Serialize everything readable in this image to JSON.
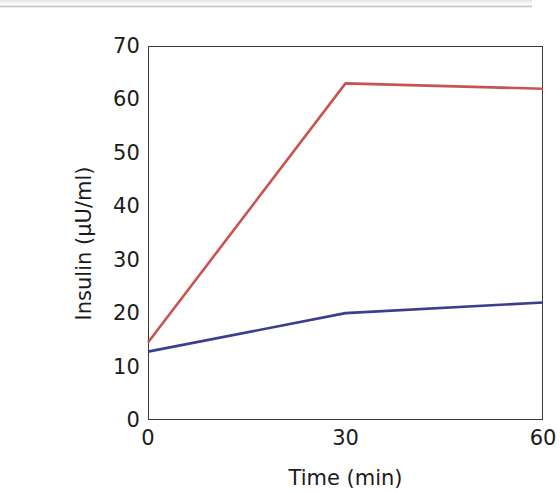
{
  "chart_data": {
    "type": "line",
    "title": "",
    "subtitle": "",
    "xlabel": "Time (min)",
    "ylabel": "Insulin  (μU/ml)",
    "xlim": [
      0,
      60
    ],
    "ylim": [
      0,
      70
    ],
    "xticks": [
      0,
      30,
      60
    ],
    "xticklabels": [
      "0",
      "30",
      "60"
    ],
    "yticks": [
      0,
      10,
      20,
      30,
      40,
      50,
      60,
      70
    ],
    "yticklabels": [
      "0",
      "10",
      "20",
      "30",
      "40",
      "50",
      "60",
      "70"
    ],
    "grid": false,
    "legend": "none",
    "frame": "box",
    "x": [
      0,
      30,
      60
    ],
    "series": [
      {
        "name": "red-series",
        "color": "#c9544f",
        "values": [
          14.5,
          63.0,
          62.0
        ]
      },
      {
        "name": "blue-series",
        "color": "#3d3d8f",
        "values": [
          12.8,
          20.0,
          22.0
        ]
      }
    ]
  },
  "axes": {
    "y_title": "Insulin  (μU/ml)",
    "x_title": "Time (min)"
  }
}
